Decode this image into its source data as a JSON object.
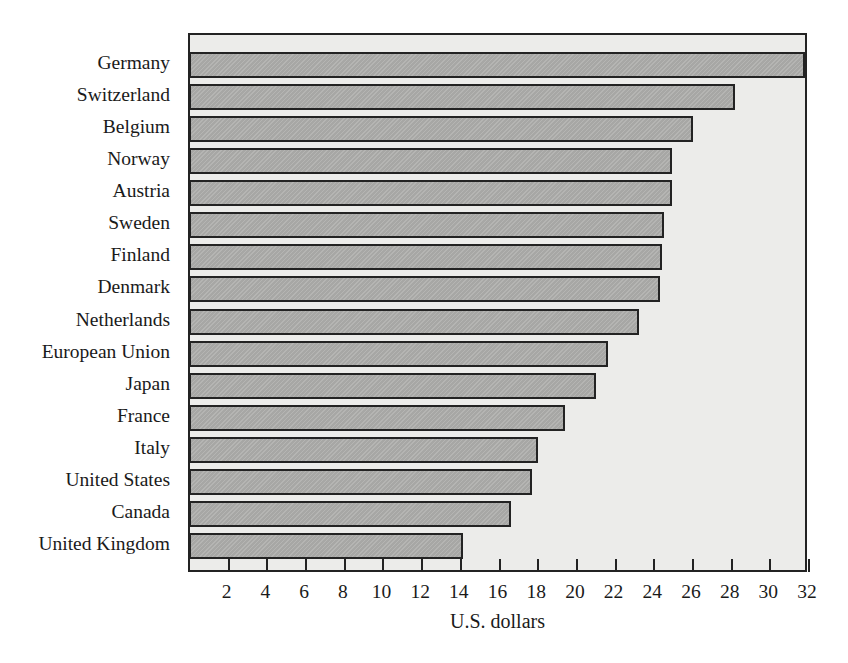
{
  "chart_data": {
    "type": "bar",
    "orientation": "horizontal",
    "title": "",
    "xlabel": "U.S. dollars",
    "ylabel": "",
    "xlim": [
      0,
      32
    ],
    "ylim": null,
    "grid": false,
    "legend": null,
    "xticks": [
      2,
      4,
      6,
      8,
      10,
      12,
      14,
      16,
      18,
      20,
      22,
      24,
      26,
      28,
      30,
      32
    ],
    "xtick_labels": [
      "2",
      "4",
      "6",
      "8",
      "10",
      "12",
      "14",
      "16",
      "18",
      "20",
      "22",
      "24",
      "26",
      "28",
      "30",
      "32"
    ],
    "categories": [
      "Germany",
      "Switzerland",
      "Belgium",
      "Norway",
      "Austria",
      "Sweden",
      "Finland",
      "Denmark",
      "Netherlands",
      "European Union",
      "Japan",
      "France",
      "Italy",
      "United States",
      "Canada",
      "United Kingdom"
    ],
    "values": [
      31.8,
      28.2,
      26.0,
      24.9,
      24.9,
      24.5,
      24.4,
      24.3,
      23.2,
      21.6,
      21.0,
      19.4,
      18.0,
      17.7,
      16.6,
      14.1
    ],
    "colors": {
      "bar_fill": "#a7a7a5",
      "bar_stroke": "#232323",
      "plot_background": "#ececea",
      "axis": "#232323",
      "text": "#1a1a1a",
      "page_background": "#ffffff"
    }
  }
}
